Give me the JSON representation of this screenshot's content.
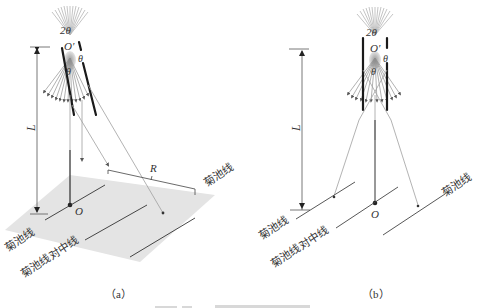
{
  "figure": {
    "panels": [
      {
        "id": "a",
        "subfigure_label": "（a）",
        "labels": {
          "two_theta": "2θ",
          "origin_prime": "O′",
          "theta_right": "θ",
          "theta_center": "θ",
          "length": "L",
          "origin": "O",
          "distance": "R",
          "kikuchi_line_left": "菊池线",
          "kikuchi_line_right": "菊池线",
          "kikuchi_center_line": "菊池线对中线"
        }
      },
      {
        "id": "b",
        "subfigure_label": "（b）",
        "labels": {
          "two_theta": "2θ",
          "origin_prime": "O′",
          "theta_right": "θ",
          "theta_center": "θ",
          "length": "L",
          "origin": "O",
          "kikuchi_line_left": "菊池线",
          "kikuchi_line_right": "菊池线",
          "kikuchi_center_line": "菊池线对中线"
        }
      }
    ],
    "colors": {
      "plane": "#e3e3e3",
      "ray": "#9a9a9a",
      "crystal_plane": "#1a1a1a",
      "text": "#333333"
    }
  }
}
